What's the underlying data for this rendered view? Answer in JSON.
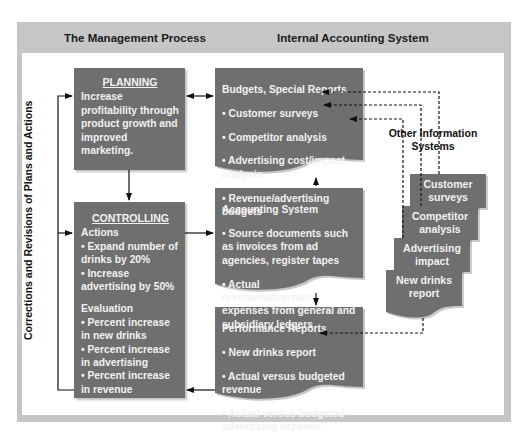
{
  "header": {
    "left_title": "The Management Process",
    "right_title": "Internal Accounting System"
  },
  "side_label": "Corrections and Revisions of Plans and Actions",
  "planning": {
    "title": "PLANNING",
    "text": "Increase profitability through product growth and improved marketing."
  },
  "controlling": {
    "title": "CONTROLLING",
    "actions_heading": "Actions",
    "actions": [
      "• Expand number of drinks by 20%",
      "• Increase advertising by 50%"
    ],
    "evaluation_heading": "Evaluation",
    "evaluation": [
      "• Percent increase in new drinks",
      "• Percent increase in advertising",
      "• Percent increase in revenue"
    ]
  },
  "budgets": {
    "title": "Budgets, Special Reports",
    "items": [
      "• Customer surveys",
      "• Competitor analysis",
      "• Advertising cost/impact analysis",
      "• Revenue/advertising budgets"
    ]
  },
  "accounting": {
    "title": "Accounting System",
    "items": [
      "• Source documents such as invoices from ad agencies, register tapes",
      "• Actual revenue/advertising expenses from general and subsidiary ledgers"
    ]
  },
  "performance": {
    "title": "Performance Reports",
    "items": [
      "• New drinks report",
      "• Actual versus budgeted revenue",
      "• Actual versus budgeted advertising expense"
    ]
  },
  "other_info": {
    "title": "Other Information Systems",
    "docs": [
      "Customer surveys",
      "Competitor analysis",
      "Advertising impact",
      "New drinks report"
    ]
  },
  "colors": {
    "frame": "#c6c6c6",
    "box_fill": "#6f6f6f",
    "box_text": "#f2f2f2",
    "line": "#111111"
  }
}
